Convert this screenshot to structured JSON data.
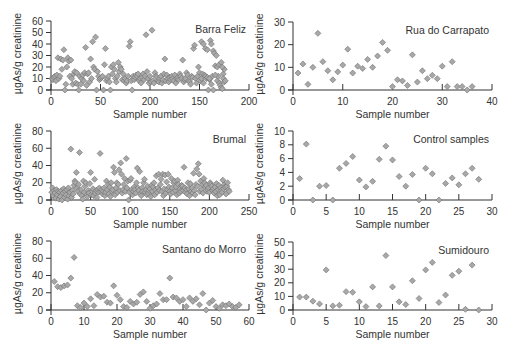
{
  "figure": {
    "y_axis_label": "µgAs/g creatinine",
    "x_axis_label": "Sample number",
    "marker_fill": "#a8a8a8",
    "marker_stroke": "#6e6e6e",
    "axis_color": "#333333"
  },
  "chart_data": [
    {
      "type": "scatter",
      "title": "Barra Feliz",
      "xlabel": "Sample number",
      "ylabel": "µgAs/g creatinine",
      "xlim": [
        0,
        200
      ],
      "ylim": [
        0,
        60
      ],
      "xticks": [
        0,
        50,
        100,
        150,
        200
      ],
      "xtick_labels": [
        "0",
        "50",
        "200",
        "150",
        "200"
      ],
      "yticks": [
        0,
        10,
        20,
        30,
        40,
        50,
        60
      ],
      "box": {
        "x0": 51,
        "x1": 249,
        "y0": 90,
        "y1": 21
      },
      "x": [
        1,
        2,
        3,
        4,
        5,
        6,
        7,
        8,
        9,
        10,
        11,
        12,
        13,
        14,
        15,
        16,
        17,
        18,
        19,
        20,
        21,
        22,
        23,
        24,
        25,
        26,
        27,
        28,
        29,
        30,
        31,
        32,
        33,
        34,
        35,
        36,
        37,
        38,
        39,
        40,
        41,
        42,
        43,
        44,
        45,
        46,
        47,
        48,
        49,
        50,
        51,
        52,
        53,
        54,
        55,
        56,
        57,
        58,
        59,
        60,
        61,
        62,
        63,
        64,
        65,
        66,
        67,
        68,
        69,
        70,
        71,
        72,
        73,
        74,
        75,
        76,
        77,
        78,
        79,
        80,
        81,
        82,
        83,
        84,
        85,
        86,
        87,
        88,
        89,
        90,
        91,
        92,
        93,
        94,
        95,
        96,
        97,
        98,
        99,
        100,
        101,
        102,
        103,
        104,
        105,
        106,
        107,
        108,
        109,
        110,
        111,
        112,
        113,
        114,
        115,
        116,
        117,
        118,
        119,
        120,
        121,
        122,
        123,
        124,
        125,
        126,
        127,
        128,
        129,
        130,
        131,
        132,
        133,
        134,
        135,
        136,
        137,
        138,
        139,
        140,
        141,
        142,
        143,
        144,
        145,
        146,
        147,
        148,
        149,
        150,
        151,
        152,
        153,
        154,
        155,
        156,
        157,
        158,
        159,
        160,
        161,
        162,
        163,
        164,
        165,
        166,
        167,
        168,
        169,
        170,
        171,
        172,
        173,
        174,
        175
      ],
      "values": [
        10,
        9,
        11,
        12,
        8,
        13,
        28,
        10,
        12,
        27,
        18,
        26,
        35,
        0,
        5,
        20,
        28,
        25,
        12,
        26,
        10,
        5,
        14,
        16,
        6,
        15,
        5,
        0,
        12,
        5,
        10,
        13,
        8,
        15,
        37,
        4,
        14,
        15,
        7,
        27,
        10,
        42,
        20,
        18,
        46,
        0,
        16,
        12,
        9,
        10,
        11,
        12,
        0,
        22,
        36,
        8,
        10,
        12,
        7,
        0,
        20,
        14,
        22,
        18,
        10,
        7,
        12,
        24,
        16,
        20,
        18,
        9,
        14,
        8,
        10,
        6,
        8,
        12,
        38,
        42,
        8,
        0,
        12,
        9,
        11,
        13,
        12,
        14,
        8,
        10,
        6,
        11,
        14,
        9,
        12,
        48,
        16,
        10,
        6,
        12,
        7,
        52,
        8,
        6,
        15,
        12,
        11,
        8,
        7,
        10,
        12,
        6,
        9,
        14,
        27,
        8,
        13,
        10,
        7,
        11,
        9,
        12,
        10,
        8,
        13,
        6,
        10,
        11,
        9,
        14,
        12,
        10,
        26,
        7,
        9,
        10,
        15,
        13,
        8,
        7,
        5,
        12,
        11,
        36,
        39,
        10,
        6,
        12,
        20,
        15,
        8,
        10,
        14,
        6,
        13,
        12,
        10,
        11,
        0,
        9,
        43,
        40,
        12,
        34,
        32,
        21,
        30,
        8,
        12,
        6,
        4,
        2,
        1,
        14,
        18
      ],
      "extra_points": [
        [
          152,
          42
        ],
        [
          154,
          40
        ],
        [
          156,
          36
        ],
        [
          158,
          35
        ],
        [
          160,
          10
        ],
        [
          162,
          5
        ],
        [
          164,
          0
        ],
        [
          166,
          13
        ],
        [
          168,
          20
        ],
        [
          170,
          22
        ],
        [
          172,
          24
        ],
        [
          173,
          20
        ],
        [
          174,
          10
        ],
        [
          175,
          7
        ],
        [
          176,
          8
        ]
      ]
    },
    {
      "type": "scatter",
      "title": "Rua do Carrapato",
      "xlabel": "Sample number",
      "ylabel": "µgAs/g creatinine",
      "xlim": [
        0,
        40
      ],
      "ylim": [
        0,
        30
      ],
      "xticks": [
        0,
        10,
        20,
        30,
        40
      ],
      "xtick_labels": [
        "0",
        "10",
        "20",
        "30",
        "40"
      ],
      "yticks": [
        0,
        10,
        20,
        30
      ],
      "box": {
        "x0": 293,
        "x1": 492,
        "y0": 90,
        "y1": 22
      },
      "x": [
        1,
        2,
        3,
        4,
        5,
        6,
        7,
        8,
        9,
        10,
        11,
        12,
        13,
        14,
        15,
        16,
        17,
        18,
        19,
        20,
        21,
        22,
        23,
        24,
        25,
        26,
        27,
        28,
        29,
        30,
        31,
        32,
        33,
        34,
        35,
        36
      ],
      "values": [
        7.5,
        11.5,
        2.5,
        10,
        25,
        12.5,
        8.5,
        4.5,
        8,
        11,
        18,
        7.5,
        10.5,
        9.5,
        13.5,
        10,
        15,
        21,
        17.5,
        1.5,
        4.5,
        4,
        2,
        15.5,
        3.5,
        8.5,
        5,
        6.5,
        5,
        10.5,
        1.5,
        12.5,
        1.5,
        1.5,
        0,
        1.5
      ]
    },
    {
      "type": "scatter",
      "title": "Brumal",
      "xlabel": "Sample number",
      "ylabel": "µgAs/g creatinine",
      "xlim": [
        0,
        250
      ],
      "ylim": [
        0,
        80
      ],
      "xticks": [
        0,
        50,
        100,
        150,
        200,
        250
      ],
      "xtick_labels": [
        "0",
        "50",
        "100",
        "150",
        "200",
        "250"
      ],
      "yticks": [
        0,
        20,
        40,
        60,
        80
      ],
      "box": {
        "x0": 51,
        "x1": 249,
        "y0": 200,
        "y1": 131
      },
      "x": [
        1,
        2,
        3,
        4,
        5,
        6,
        7,
        8,
        9,
        10,
        11,
        12,
        13,
        14,
        15,
        16,
        17,
        18,
        19,
        20,
        21,
        22,
        23,
        24,
        25,
        26,
        27,
        28,
        29,
        30,
        31,
        32,
        33,
        34,
        35,
        36,
        37,
        38,
        39,
        40,
        41,
        42,
        43,
        44,
        45,
        46,
        47,
        48,
        49,
        50,
        51,
        52,
        53,
        54,
        55,
        56,
        57,
        58,
        59,
        60,
        61,
        62,
        63,
        64,
        65,
        66,
        67,
        68,
        69,
        70,
        71,
        72,
        73,
        74,
        75,
        76,
        77,
        78,
        79,
        80,
        81,
        82,
        83,
        84,
        85,
        86,
        87,
        88,
        89,
        90,
        91,
        92,
        93,
        94,
        95,
        96,
        97,
        98,
        99,
        100,
        101,
        102,
        103,
        104,
        105,
        106,
        107,
        108,
        109,
        110,
        111,
        112,
        113,
        114,
        115,
        116,
        117,
        118,
        119,
        120,
        121,
        122,
        123,
        124,
        125,
        126,
        127,
        128,
        129,
        130,
        131,
        132,
        133,
        134,
        135,
        136,
        137,
        138,
        139,
        140,
        141,
        142,
        143,
        144,
        145,
        146,
        147,
        148,
        149,
        150,
        151,
        152,
        153,
        154,
        155,
        156,
        157,
        158,
        159,
        160,
        161,
        162,
        163,
        164,
        165,
        166,
        167,
        168,
        169,
        170,
        171,
        172,
        173,
        174,
        175,
        176,
        177,
        178,
        179,
        180,
        181,
        182,
        183,
        184,
        185,
        186,
        187,
        188,
        189,
        190,
        191,
        192,
        193,
        194,
        195,
        196,
        197,
        198,
        199,
        200,
        201,
        202,
        203,
        204,
        205,
        206,
        207,
        208,
        209,
        210,
        211,
        212,
        213,
        214,
        215,
        216,
        217,
        218,
        219,
        220,
        221,
        222,
        223,
        224,
        225
      ],
      "values": [
        9,
        14,
        5,
        11,
        8,
        2,
        12,
        6,
        10,
        1,
        9,
        4,
        11,
        0,
        8,
        13,
        3,
        10,
        6,
        12,
        1,
        14,
        5,
        9,
        59,
        3,
        11,
        7,
        17,
        22,
        20,
        32,
        14,
        10,
        18,
        55,
        7,
        12,
        5,
        1,
        22,
        9,
        16,
        20,
        6,
        4,
        11,
        8,
        19,
        32,
        6,
        10,
        13,
        5,
        24,
        8,
        11,
        3,
        12,
        9,
        14,
        54,
        10,
        12,
        7,
        10,
        14,
        5,
        9,
        22,
        12,
        18,
        7,
        15,
        4,
        20,
        10,
        12,
        38,
        32,
        6,
        14,
        20,
        9,
        18,
        35,
        11,
        43,
        30,
        8,
        12,
        18,
        25,
        10,
        48,
        14,
        22,
        0,
        9,
        23,
        25,
        12,
        6,
        10,
        15,
        12,
        8,
        20,
        37,
        14,
        11,
        33,
        7,
        5,
        14,
        10,
        20,
        24,
        9,
        12,
        6,
        16,
        8,
        11,
        13,
        4,
        17,
        10,
        15,
        20,
        6,
        12,
        28,
        9,
        14,
        30,
        11,
        18,
        24,
        10,
        30,
        5,
        13,
        29,
        8,
        21,
        12,
        30,
        15,
        10,
        7,
        25,
        14,
        9,
        20,
        22,
        11,
        15,
        6,
        23,
        18,
        8,
        13,
        10,
        17,
        16,
        11,
        38,
        14,
        9,
        12,
        7,
        20,
        13,
        5,
        19,
        10,
        14,
        8,
        31,
        11,
        6,
        18,
        36,
        16,
        42,
        30,
        10,
        22,
        12,
        18,
        8,
        25,
        20,
        15,
        17,
        10,
        12,
        14,
        9,
        20,
        18,
        16,
        11,
        13,
        8,
        15,
        10,
        19,
        5,
        12,
        17,
        6,
        14,
        11,
        9,
        23,
        13,
        18,
        15,
        7,
        16,
        20,
        12,
        10
      ]
    },
    {
      "type": "scatter",
      "title": "Control samples",
      "xlabel": "Sample number",
      "ylabel": "µgAs/g creatinine",
      "xlim": [
        0,
        30
      ],
      "ylim": [
        0,
        10
      ],
      "xticks": [
        0,
        5,
        10,
        15,
        20,
        25,
        30
      ],
      "xtick_labels": [
        "0",
        "5",
        "10",
        "15",
        "20",
        "25",
        "30"
      ],
      "yticks": [
        0,
        2,
        4,
        6,
        8,
        10
      ],
      "box": {
        "x0": 293,
        "x1": 492,
        "y0": 200,
        "y1": 131
      },
      "x": [
        1,
        2,
        3,
        4,
        5,
        6,
        7,
        8,
        9,
        10,
        11,
        12,
        13,
        14,
        15,
        16,
        17,
        18,
        19,
        20,
        21,
        22,
        23,
        24,
        25,
        26,
        27,
        28
      ],
      "values": [
        3.1,
        8.1,
        0,
        2,
        2.1,
        0,
        4.6,
        5.3,
        6.3,
        2.9,
        1.9,
        2.7,
        5.9,
        7.8,
        5.8,
        3.4,
        2,
        3.7,
        0,
        4.6,
        3.8,
        0,
        2.4,
        3.2,
        2.2,
        3.8,
        4.6,
        3
      ]
    },
    {
      "type": "scatter",
      "title": "Santano do Morro",
      "xlabel": "Sample number",
      "ylabel": "µgAs/g creatinine",
      "xlim": [
        0,
        60
      ],
      "ylim": [
        0,
        80
      ],
      "xticks": [
        0,
        10,
        20,
        30,
        40,
        50,
        60
      ],
      "xtick_labels": [
        "0",
        "10",
        "20",
        "30",
        "40",
        "50",
        "60"
      ],
      "yticks": [
        0,
        20,
        40,
        60,
        80
      ],
      "box": {
        "x0": 51,
        "x1": 249,
        "y0": 310,
        "y1": 241
      },
      "x": [
        1,
        2,
        3,
        4,
        5,
        6,
        7,
        8,
        9,
        10,
        11,
        12,
        13,
        14,
        15,
        16,
        17,
        18,
        19,
        20,
        21,
        22,
        23,
        24,
        25,
        26,
        27,
        28,
        29,
        30,
        31,
        32,
        33,
        34,
        35,
        36,
        37,
        38,
        39,
        40,
        41,
        42,
        43,
        44,
        45,
        46,
        47,
        48,
        49,
        50,
        51,
        52,
        53,
        54,
        55,
        56,
        57
      ],
      "values": [
        33,
        27,
        26,
        28,
        29,
        37,
        61,
        5,
        3,
        8,
        4,
        13,
        5,
        18,
        15,
        16,
        9,
        8,
        28,
        17,
        12,
        4,
        3,
        10,
        7,
        9,
        18,
        21,
        10,
        2,
        5,
        7,
        19,
        12,
        12,
        37,
        15,
        14,
        10,
        12,
        4,
        14,
        10,
        13,
        6,
        19,
        0,
        8,
        11,
        4,
        2,
        6,
        5,
        7,
        4,
        3,
        6
      ]
    },
    {
      "type": "scatter",
      "title": "Sumidouro",
      "xlabel": "Sample number",
      "ylabel": "µgAs/g creatinine",
      "xlim": [
        0,
        30
      ],
      "ylim": [
        0,
        50
      ],
      "xticks": [
        0,
        5,
        10,
        15,
        20,
        25,
        30
      ],
      "xtick_labels": [
        "0",
        "5",
        "10",
        "15",
        "20",
        "25",
        "30"
      ],
      "yticks": [
        0,
        10,
        20,
        30,
        40,
        50
      ],
      "box": {
        "x0": 293,
        "x1": 492,
        "y0": 310,
        "y1": 242
      },
      "x": [
        1,
        2,
        3,
        4,
        5,
        6,
        7,
        8,
        9,
        10,
        11,
        12,
        13,
        14,
        15,
        16,
        17,
        18,
        19,
        20,
        21,
        22,
        23,
        24,
        25,
        26,
        27,
        28
      ],
      "values": [
        9.5,
        9.5,
        6.5,
        4.5,
        29.5,
        3,
        3.5,
        13.5,
        13,
        6,
        2.5,
        17,
        3,
        40,
        17,
        6,
        4,
        21.5,
        8.5,
        29.5,
        35,
        5.5,
        11,
        25.5,
        28.5,
        0.5,
        33,
        0
      ]
    }
  ]
}
